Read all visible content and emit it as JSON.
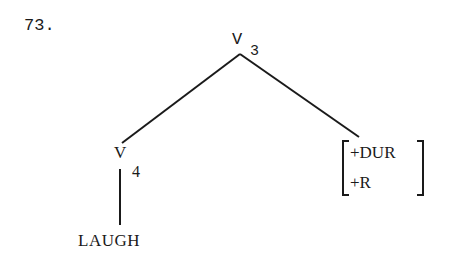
{
  "example_number": "73.",
  "tree": {
    "root": {
      "label": "V",
      "subscript": "3"
    },
    "left_child": {
      "label": "V",
      "subscript": "4"
    },
    "left_leaf": {
      "label": "LAUGH"
    },
    "right_child": {
      "type": "feature-matrix",
      "features": [
        "+DUR",
        "+R"
      ]
    }
  },
  "colors": {
    "ink": "#1a1a1a",
    "background": "#ffffff"
  }
}
